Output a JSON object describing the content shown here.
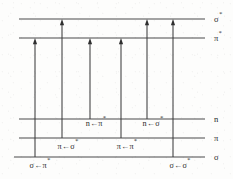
{
  "diagram": {
    "type": "energy-level-diagram",
    "line_color": "#4a4a4a",
    "arrow_color": "#3d3d3d",
    "text_color": "#2b2b2b",
    "background_color": "#fdfdfc",
    "levels": [
      {
        "id": "sigma-star",
        "label": "σ",
        "superscript": "*",
        "y": 19,
        "x_start": 19,
        "x_end": 205,
        "label_x": 214
      },
      {
        "id": "pi-star",
        "label": "π",
        "superscript": "*",
        "y": 38,
        "x_start": 19,
        "x_end": 205,
        "label_x": 214
      },
      {
        "id": "n",
        "label": "n",
        "superscript": "",
        "y": 119,
        "x_start": 19,
        "x_end": 205,
        "label_x": 214
      },
      {
        "id": "pi",
        "label": "π",
        "superscript": "",
        "y": 138,
        "x_start": 19,
        "x_end": 205,
        "label_x": 214
      },
      {
        "id": "sigma",
        "label": "σ",
        "superscript": "",
        "y": 157,
        "x_start": 14,
        "x_end": 205,
        "label_x": 214
      }
    ],
    "transitions": [
      {
        "id": "sigma-to-pi-star",
        "label": "σ←π",
        "superscript": "*",
        "x": 35,
        "from_y": 157,
        "to_y": 38,
        "label_x": 40,
        "label_y": 168
      },
      {
        "id": "pi-to-sigma-star",
        "label": "π←σ",
        "superscript": "*",
        "x": 62,
        "from_y": 138,
        "to_y": 19,
        "label_x": 68,
        "label_y": 149
      },
      {
        "id": "n-to-pi-star",
        "label": "n←π",
        "superscript": "*",
        "x": 90,
        "from_y": 119,
        "to_y": 38,
        "label_x": 96,
        "label_y": 126
      },
      {
        "id": "pi-to-pi-star",
        "label": "π←π",
        "superscript": "*",
        "x": 121,
        "from_y": 138,
        "to_y": 38,
        "label_x": 127,
        "label_y": 149
      },
      {
        "id": "n-to-sigma-star",
        "label": "n←σ",
        "superscript": "*",
        "x": 147,
        "from_y": 119,
        "to_y": 19,
        "label_x": 153,
        "label_y": 126
      },
      {
        "id": "sigma-to-sigma-star",
        "label": "σ←σ",
        "superscript": "*",
        "x": 173,
        "from_y": 157,
        "to_y": 19,
        "label_x": 180,
        "label_y": 168
      }
    ]
  }
}
